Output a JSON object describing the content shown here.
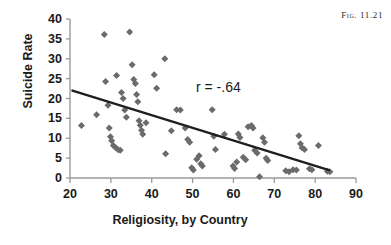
{
  "figure": {
    "caption": "Fig. 11.21"
  },
  "chart_data": {
    "type": "scatter",
    "title": "",
    "xlabel": "Religiosity, by Country",
    "ylabel": "Suicide Rate",
    "xlim": [
      20,
      90
    ],
    "ylim": [
      0,
      40
    ],
    "xticks": [
      20,
      30,
      40,
      50,
      60,
      70,
      80,
      90
    ],
    "yticks": [
      0,
      5,
      10,
      15,
      20,
      25,
      30,
      35,
      40
    ],
    "grid": false,
    "legend": null,
    "annotations": [
      {
        "name": "correlation-coefficient",
        "text": "r = -.64",
        "x": 55,
        "y": 21.5
      }
    ],
    "marker": {
      "shape": "diamond",
      "color": "#6b6b6b",
      "size": 7
    },
    "trendline": {
      "name": "regression-line",
      "color": "#1f1f1f",
      "width": 2.4,
      "x_start": 20.6,
      "y_start": 22.0,
      "x_end": 83.4,
      "y_end": 2.0,
      "slope": -0.318,
      "intercept": 28.6
    },
    "points": [
      [
        22.8,
        13.2
      ],
      [
        26.5,
        15.9
      ],
      [
        28.4,
        36.1
      ],
      [
        28.7,
        24.3
      ],
      [
        29.3,
        18.3
      ],
      [
        29.6,
        12.6
      ],
      [
        29.9,
        10.4
      ],
      [
        30.2,
        9.4
      ],
      [
        30.6,
        8.2
      ],
      [
        31.2,
        7.6
      ],
      [
        31.4,
        25.8
      ],
      [
        31.8,
        7.1
      ],
      [
        32.3,
        7.0
      ],
      [
        32.6,
        21.5
      ],
      [
        33.0,
        20.0
      ],
      [
        33.4,
        17.1
      ],
      [
        33.8,
        15.3
      ],
      [
        34.6,
        36.7
      ],
      [
        35.2,
        28.5
      ],
      [
        35.6,
        24.8
      ],
      [
        36.0,
        23.8
      ],
      [
        36.3,
        21.0
      ],
      [
        36.6,
        19.2
      ],
      [
        36.9,
        14.4
      ],
      [
        37.2,
        13.3
      ],
      [
        37.5,
        12.0
      ],
      [
        37.8,
        11.0
      ],
      [
        38.6,
        13.9
      ],
      [
        40.6,
        26.0
      ],
      [
        41.2,
        22.6
      ],
      [
        43.2,
        30.0
      ],
      [
        43.4,
        6.1
      ],
      [
        44.8,
        11.9
      ],
      [
        46.1,
        17.2
      ],
      [
        47.0,
        17.1
      ],
      [
        48.2,
        12.6
      ],
      [
        48.8,
        9.7
      ],
      [
        49.3,
        9.0
      ],
      [
        49.8,
        2.6
      ],
      [
        50.2,
        2.0
      ],
      [
        51.0,
        4.7
      ],
      [
        51.6,
        5.6
      ],
      [
        52.0,
        3.6
      ],
      [
        52.4,
        3.0
      ],
      [
        54.8,
        17.2
      ],
      [
        55.2,
        10.5
      ],
      [
        55.6,
        7.2
      ],
      [
        57.8,
        11.0
      ],
      [
        59.9,
        3.0
      ],
      [
        60.3,
        2.4
      ],
      [
        60.8,
        4.0
      ],
      [
        61.2,
        11.1
      ],
      [
        61.6,
        10.2
      ],
      [
        62.4,
        5.2
      ],
      [
        63.0,
        4.6
      ],
      [
        63.6,
        12.9
      ],
      [
        64.4,
        13.2
      ],
      [
        64.8,
        12.6
      ],
      [
        65.2,
        7.0
      ],
      [
        65.8,
        6.3
      ],
      [
        66.4,
        0.3
      ],
      [
        67.2,
        10.1
      ],
      [
        67.6,
        9.0
      ],
      [
        68.0,
        5.0
      ],
      [
        68.4,
        4.4
      ],
      [
        72.8,
        1.8
      ],
      [
        73.6,
        1.6
      ],
      [
        74.6,
        2.1
      ],
      [
        75.4,
        2.0
      ],
      [
        76.0,
        10.6
      ],
      [
        76.4,
        8.6
      ],
      [
        76.8,
        7.6
      ],
      [
        77.4,
        7.2
      ],
      [
        78.6,
        2.3
      ],
      [
        79.2,
        2.1
      ],
      [
        80.8,
        8.2
      ],
      [
        83.0,
        1.7
      ],
      [
        83.6,
        1.6
      ]
    ]
  }
}
